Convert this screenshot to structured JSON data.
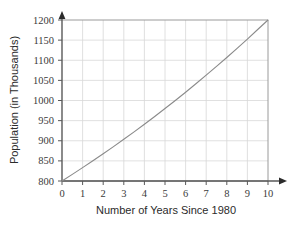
{
  "chart_data": {
    "type": "line",
    "title": "",
    "subtitle": "",
    "xlabel": "Number of Years Since 1980",
    "ylabel": "Population (in Thousands)",
    "xlim": [
      0,
      10
    ],
    "ylim": [
      800,
      1200
    ],
    "xticks": [
      0,
      1,
      2,
      3,
      4,
      5,
      6,
      7,
      8,
      9,
      10
    ],
    "xtick_labels": [
      "0",
      "1",
      "2",
      "3",
      "4",
      "5",
      "6",
      "7",
      "8",
      "9",
      "10"
    ],
    "yticks": [
      800,
      850,
      900,
      950,
      1000,
      1050,
      1100,
      1150,
      1200
    ],
    "ytick_labels": [
      "800",
      "850",
      "900",
      "950",
      "1000",
      "1050",
      "1100",
      "1150",
      "1200"
    ],
    "grid": true,
    "grid_axis": "both",
    "legend": false,
    "legend_position": "none",
    "series": [
      {
        "name": "Population",
        "x": [
          0,
          0.5,
          1,
          1.5,
          2,
          2.5,
          3,
          3.5,
          4,
          4.5,
          5,
          5.5,
          6,
          6.5,
          7,
          7.5,
          8,
          8.5,
          9,
          9.5,
          10
        ],
        "values": [
          800,
          816.4,
          833.2,
          850.3,
          867.7,
          885.5,
          903.6,
          922.1,
          941.0,
          960.2,
          980.0,
          1000.1,
          1020.6,
          1041.5,
          1062.9,
          1084.7,
          1106.9,
          1129.6,
          1152.7,
          1176.4,
          1200
        ]
      }
    ],
    "annotations": [],
    "line_color": "#8a8a8a",
    "grid_color": "#d8d8d8",
    "axis_color": "#595959"
  },
  "axis": {
    "y_title": "Population (in Thousands)",
    "x_title": "Number of Years Since 1980"
  },
  "colors": {
    "background": "#ffffff",
    "curve": "#8a8a8a",
    "grid": "#d8d8d8",
    "axis": "#595959",
    "text": "#3a3a3a"
  }
}
